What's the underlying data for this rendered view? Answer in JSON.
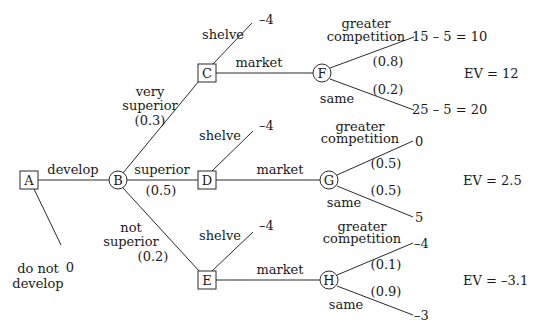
{
  "diagram": {
    "type": "decision-tree",
    "nodes": {
      "A": {
        "label": "A",
        "shape": "square"
      },
      "B": {
        "label": "B",
        "shape": "circle"
      },
      "C": {
        "label": "C",
        "shape": "square"
      },
      "D": {
        "label": "D",
        "shape": "square"
      },
      "E": {
        "label": "E",
        "shape": "square"
      },
      "F": {
        "label": "F",
        "shape": "circle"
      },
      "G": {
        "label": "G",
        "shape": "circle"
      },
      "H": {
        "label": "H",
        "shape": "circle"
      }
    },
    "branches": {
      "develop": "develop",
      "do_not_develop_line1": "do not",
      "do_not_develop_line2": "develop",
      "do_not_develop_value": "0",
      "very_superior_line1": "very",
      "very_superior_line2": "superior",
      "very_superior_prob": "(0.3)",
      "superior": "superior",
      "superior_prob": "(0.5)",
      "not_superior_line1": "not",
      "not_superior_line2": "superior",
      "not_superior_prob": "(0.2)",
      "shelve": "shelve",
      "market": "market",
      "greater_line1": "greater",
      "greater_line2": "competition",
      "same": "same"
    },
    "C_branch": {
      "shelve_value": "–4",
      "F_greater_prob": "(0.8)",
      "F_same_prob": "(0.2)",
      "F_greater_value": "15 – 5 = 10",
      "F_same_value": "25 – 5 = 20",
      "ev": "EV = 12"
    },
    "D_branch": {
      "shelve_value": "–4",
      "G_greater_prob": "(0.5)",
      "G_same_prob": "(0.5)",
      "G_greater_value": "0",
      "G_same_value": "5",
      "ev": "EV = 2.5"
    },
    "E_branch": {
      "shelve_value": "–4",
      "H_greater_prob": "(0.1)",
      "H_same_prob": "(0.9)",
      "H_greater_value": "–4",
      "H_same_value": "–3",
      "ev": "EV = –3.1"
    },
    "colors": {
      "stroke": "#2a2a2a",
      "text": "#1a1a1a",
      "background": "#ffffff"
    }
  }
}
